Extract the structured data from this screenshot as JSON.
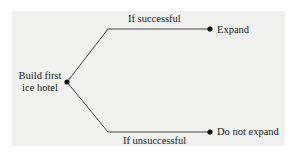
{
  "diagram": {
    "type": "decision-tree",
    "root": {
      "label_line1": "Build first",
      "label_line2": "ice hotel"
    },
    "branches": [
      {
        "condition": "If successful",
        "outcome": "Expand"
      },
      {
        "condition": "If unsuccessful",
        "outcome": "Do not expand"
      }
    ],
    "colors": {
      "panel": "#f0f0ef",
      "line": "#444444",
      "node": "#111111"
    }
  }
}
